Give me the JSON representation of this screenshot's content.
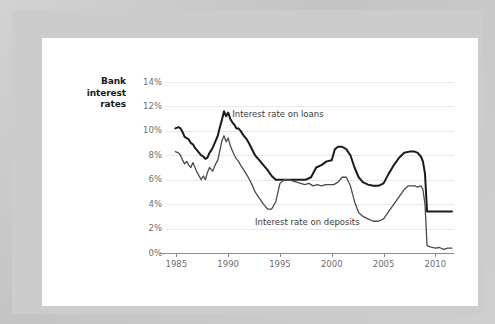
{
  "card": {
    "background_color": "#ffffff",
    "frame_color": "#cccccc"
  },
  "chart_data": {
    "type": "line",
    "title": "Bank interest rates",
    "title_lines": [
      "Bank",
      "interest",
      "rates"
    ],
    "xlabel": "",
    "ylabel": "",
    "xlim": [
      1984.0,
      2011.8
    ],
    "ylim": [
      0,
      14
    ],
    "grid": true,
    "legend_position": "inline-annotations",
    "yticks": [
      0,
      2,
      4,
      6,
      8,
      10,
      12,
      14
    ],
    "ytick_labels": [
      "0%",
      "2%",
      "4%",
      "6%",
      "8%",
      "10%",
      "12%",
      "14%"
    ],
    "xticks": [
      1985,
      1990,
      1995,
      2000,
      2005,
      2010
    ],
    "xtick_labels": [
      "1985",
      "1990",
      "1995",
      "2000",
      "2005",
      "2010"
    ],
    "annotations": [
      {
        "text": "Interest rate on loans",
        "x": 1990.4,
        "y": 11.35
      },
      {
        "text": "Interest rate on deposits",
        "x": 1992.6,
        "y": 2.55
      }
    ],
    "series": [
      {
        "name": "Interest rate on loans",
        "color": "#1a1a1a",
        "line_width": 2.0,
        "x": [
          1984.9,
          1985.2,
          1985.4,
          1985.6,
          1985.8,
          1986.0,
          1986.2,
          1986.4,
          1986.6,
          1986.8,
          1987.0,
          1987.2,
          1987.4,
          1987.6,
          1987.8,
          1988.0,
          1988.2,
          1988.5,
          1988.8,
          1989.0,
          1989.2,
          1989.4,
          1989.6,
          1989.8,
          1990.0,
          1990.2,
          1990.4,
          1990.6,
          1990.8,
          1991.0,
          1991.2,
          1991.5,
          1991.8,
          1992.0,
          1992.3,
          1992.6,
          1993.0,
          1993.4,
          1993.8,
          1994.2,
          1994.6,
          1995.0,
          1995.5,
          1996.0,
          1996.5,
          1997.0,
          1997.5,
          1998.0,
          1998.5,
          1999.0,
          1999.5,
          2000.0,
          2000.3,
          2000.6,
          2001.0,
          2001.4,
          2001.8,
          2002.2,
          2002.6,
          2003.0,
          2003.5,
          2004.0,
          2004.5,
          2005.0,
          2005.5,
          2006.0,
          2006.5,
          2007.0,
          2007.5,
          2008.0,
          2008.3,
          2008.6,
          2008.8,
          2009.0,
          2009.2,
          2009.5,
          2010.0,
          2010.5,
          2011.0,
          2011.6
        ],
        "y": [
          10.2,
          10.3,
          10.2,
          9.9,
          9.5,
          9.4,
          9.3,
          9.0,
          8.9,
          8.6,
          8.4,
          8.2,
          8.0,
          7.9,
          7.7,
          7.8,
          8.2,
          8.6,
          9.2,
          9.6,
          10.3,
          10.9,
          11.6,
          11.2,
          11.5,
          11.0,
          10.7,
          10.5,
          10.2,
          10.2,
          10.0,
          9.6,
          9.3,
          9.0,
          8.5,
          8.0,
          7.6,
          7.2,
          6.8,
          6.3,
          6.0,
          6.0,
          6.0,
          6.0,
          6.0,
          6.0,
          6.0,
          6.2,
          7.0,
          7.2,
          7.5,
          7.6,
          8.5,
          8.7,
          8.7,
          8.5,
          8.0,
          7.0,
          6.2,
          5.8,
          5.6,
          5.5,
          5.5,
          5.7,
          6.5,
          7.2,
          7.8,
          8.2,
          8.3,
          8.3,
          8.2,
          7.9,
          7.5,
          6.5,
          3.4,
          3.4,
          3.4,
          3.4,
          3.4,
          3.4
        ]
      },
      {
        "name": "Interest rate on deposits",
        "color": "#4a4a4a",
        "line_width": 1.3,
        "x": [
          1984.9,
          1985.2,
          1985.4,
          1985.6,
          1985.8,
          1986.0,
          1986.2,
          1986.4,
          1986.6,
          1986.8,
          1987.0,
          1987.2,
          1987.4,
          1987.6,
          1987.8,
          1988.0,
          1988.2,
          1988.5,
          1988.8,
          1989.0,
          1989.2,
          1989.4,
          1989.6,
          1989.8,
          1990.0,
          1990.2,
          1990.4,
          1990.6,
          1990.8,
          1991.0,
          1991.2,
          1991.5,
          1991.8,
          1992.0,
          1992.3,
          1992.6,
          1993.0,
          1993.4,
          1993.8,
          1994.2,
          1994.6,
          1995.0,
          1995.4,
          1995.8,
          1996.2,
          1996.6,
          1997.0,
          1997.4,
          1997.8,
          1998.2,
          1998.6,
          1999.0,
          1999.4,
          1999.8,
          2000.2,
          2000.6,
          2001.0,
          2001.4,
          2001.8,
          2002.2,
          2002.6,
          2003.0,
          2003.5,
          2004.0,
          2004.5,
          2005.0,
          2005.5,
          2006.0,
          2006.5,
          2007.0,
          2007.4,
          2007.8,
          2008.0,
          2008.3,
          2008.6,
          2008.8,
          2009.0,
          2009.2,
          2009.5,
          2010.0,
          2010.4,
          2010.8,
          2011.2,
          2011.6
        ],
        "y": [
          8.3,
          8.2,
          8.0,
          7.6,
          7.3,
          7.5,
          7.2,
          7.0,
          7.4,
          7.0,
          6.6,
          6.3,
          6.0,
          6.3,
          6.0,
          6.6,
          7.0,
          6.7,
          7.3,
          7.6,
          8.4,
          9.2,
          9.6,
          9.1,
          9.4,
          8.8,
          8.4,
          8.0,
          7.7,
          7.5,
          7.2,
          6.8,
          6.4,
          6.1,
          5.6,
          5.0,
          4.5,
          4.0,
          3.6,
          3.6,
          4.2,
          5.7,
          6.0,
          6.0,
          5.9,
          5.8,
          5.7,
          5.6,
          5.7,
          5.5,
          5.6,
          5.5,
          5.6,
          5.6,
          5.6,
          5.8,
          6.2,
          6.2,
          5.5,
          4.2,
          3.3,
          3.0,
          2.8,
          2.6,
          2.6,
          2.8,
          3.4,
          4.0,
          4.6,
          5.2,
          5.5,
          5.5,
          5.5,
          5.4,
          5.5,
          5.2,
          4.0,
          0.6,
          0.5,
          0.4,
          0.45,
          0.3,
          0.4,
          0.4
        ]
      }
    ]
  }
}
